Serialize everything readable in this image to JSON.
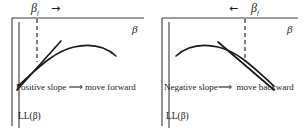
{
  "figure": {
    "caption_type": "two-panel gradient-direction diagram",
    "stroke_color": "#1a1a1a",
    "background_color": "#ffffff"
  },
  "panels": [
    {
      "id": "positive-slope",
      "marker_label": "β",
      "marker_subscript": "f",
      "direction_arrow": "→",
      "axis_label": "β",
      "vertical_axis_label": "LL(β)",
      "caption_lead": "Positive slope",
      "caption_implies": "⟹",
      "caption_action": "move forward",
      "slope_sign": "positive",
      "dashed_line_x": 33,
      "curve": "concave, rising through marker then peaking right of it",
      "tangent": "upward-sloping line through curve at marker"
    },
    {
      "id": "negative-slope",
      "marker_label": "β",
      "marker_subscript": "f",
      "direction_arrow": "←",
      "axis_label": "β",
      "vertical_axis_label": "LL(β)",
      "caption_lead": "Negative slope",
      "caption_implies": "⟹",
      "caption_action": "move backward",
      "slope_sign": "negative",
      "dashed_line_x": 89,
      "curve": "concave, peaking left of marker then falling through it",
      "tangent": "downward-sloping line through curve at marker"
    }
  ]
}
